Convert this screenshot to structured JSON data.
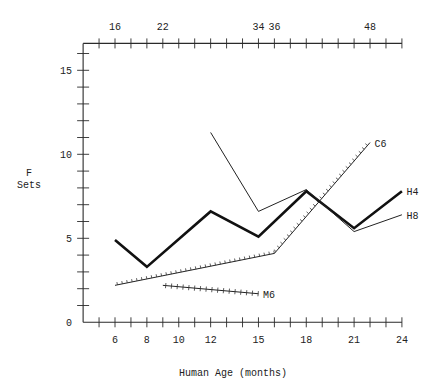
{
  "chart_data": {
    "type": "line",
    "title": "",
    "xlabel": "Human Age (months)",
    "ylabel": "F Sets",
    "ylabel_lines": [
      "F",
      "Sets"
    ],
    "xlim": [
      4,
      24
    ],
    "ylim": [
      0,
      16.6
    ],
    "grid": false,
    "legend": "inline labels at line ends",
    "x_ticks": [
      6,
      8,
      10,
      12,
      15,
      18,
      21,
      24
    ],
    "x_minor_ticks": [
      5,
      6,
      7,
      8,
      9,
      10,
      11,
      12,
      13,
      14,
      15,
      16,
      17,
      18,
      19,
      20,
      21,
      22,
      23,
      24
    ],
    "y_ticks": [
      0,
      5,
      10,
      15
    ],
    "y_minor_ticks": [
      1,
      2,
      3,
      4,
      5,
      6,
      7,
      8,
      9,
      10,
      11,
      12,
      13,
      14,
      15,
      16
    ],
    "top_axis": {
      "ticks": [
        {
          "x": 6,
          "label": "16"
        },
        {
          "x": 9,
          "label": "22"
        },
        {
          "x": 15,
          "label": "34"
        },
        {
          "x": 16,
          "label": "36"
        },
        {
          "x": 22,
          "label": "48"
        }
      ]
    },
    "series": [
      {
        "name": "H4",
        "style": "thick",
        "x": [
          6,
          8,
          12,
          15,
          18,
          21,
          24
        ],
        "y": [
          4.9,
          3.3,
          6.6,
          5.1,
          7.8,
          5.6,
          7.8
        ]
      },
      {
        "name": "H8",
        "style": "thin",
        "x": [
          12,
          15,
          18,
          21,
          24
        ],
        "y": [
          11.3,
          6.6,
          7.9,
          5.4,
          6.4
        ]
      },
      {
        "name": "C6",
        "style": "hatched",
        "x": [
          6,
          16,
          22
        ],
        "y": [
          2.2,
          4.1,
          10.7
        ]
      },
      {
        "name": "M6",
        "style": "crossed",
        "x": [
          9,
          15
        ],
        "y": [
          2.2,
          1.7
        ]
      }
    ]
  }
}
